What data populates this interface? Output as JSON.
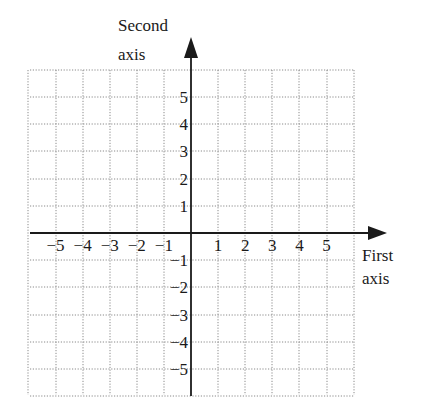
{
  "chart_data": {
    "type": "coordinate-grid",
    "title": "",
    "xlabel": "First axis",
    "ylabel": "Second axis",
    "xlabel_lines": [
      "First",
      "axis"
    ],
    "ylabel_lines": [
      "Second",
      "axis"
    ],
    "x_ticks": [
      -5,
      -4,
      -3,
      -2,
      -1,
      1,
      2,
      3,
      4,
      5
    ],
    "y_ticks": [
      5,
      4,
      3,
      2,
      1,
      -1,
      -2,
      -3,
      -4,
      -5
    ],
    "x_tick_labels": [
      "−5",
      "−4",
      "−3",
      "−2",
      "−1",
      "1",
      "2",
      "3",
      "4",
      "5"
    ],
    "y_tick_labels": [
      "5",
      "4",
      "3",
      "2",
      "1",
      "−1",
      "−2",
      "−3",
      "−4",
      "−5"
    ],
    "xlim": [
      -6,
      6
    ],
    "ylim": [
      -6,
      6
    ],
    "grid": true,
    "grid_style": "dotted",
    "axis_arrows": [
      "positive-x",
      "positive-y"
    ]
  },
  "colors": {
    "axis": "#1a1a1a",
    "grid": "#8a8a8a",
    "text": "#1a1a1a"
  }
}
